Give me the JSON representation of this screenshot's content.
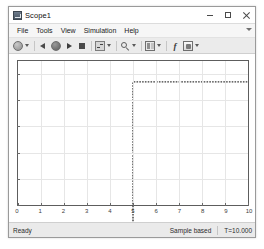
{
  "window": {
    "title": "Scope1",
    "icon": "scope-icon",
    "controls": {
      "minimize": "Minimize",
      "maximize": "Maximize",
      "close": "Close"
    }
  },
  "menu": {
    "items": [
      {
        "label": "File"
      },
      {
        "label": "Tools"
      },
      {
        "label": "View"
      },
      {
        "label": "Simulation"
      },
      {
        "label": "Help"
      }
    ],
    "overflow": "menu-caret-icon"
  },
  "toolbar": {
    "buttons": [
      {
        "name": "print-icon",
        "kind": "circle",
        "dropdown": true
      },
      {
        "name": "step-back-icon",
        "kind": "back",
        "dropdown": false
      },
      {
        "name": "rewind-icon",
        "kind": "circle-dark",
        "dropdown": false
      },
      {
        "name": "run-icon",
        "kind": "play",
        "dropdown": false
      },
      {
        "name": "stop-icon",
        "kind": "stop",
        "dropdown": false
      },
      {
        "name": "step-forward-icon",
        "kind": "step",
        "dropdown": true
      },
      {
        "name": "zoom-icon",
        "kind": "zoom",
        "dropdown": true
      },
      {
        "name": "layout-icon",
        "kind": "layout",
        "dropdown": true
      },
      {
        "name": "measurements-icon",
        "kind": "fx",
        "label": "f",
        "dropdown": false
      },
      {
        "name": "config-properties-icon",
        "kind": "cfg",
        "dropdown": true
      }
    ]
  },
  "statusbar": {
    "left": "Ready",
    "mode": "Sample based",
    "time": "T=10.000"
  },
  "chart_data": {
    "type": "line",
    "title": "",
    "xlabel": "",
    "ylabel": "",
    "xlim": [
      0,
      10
    ],
    "ylim": [
      0,
      1.1
    ],
    "xticks": [
      0,
      1,
      2,
      3,
      4,
      5,
      6,
      7,
      8,
      9,
      10
    ],
    "xticklabels": [
      "0",
      "1",
      "2",
      "3",
      "4",
      "5",
      "6",
      "7",
      "8",
      "9",
      "10"
    ],
    "yticks": [
      0,
      0.2,
      0.4,
      0.6,
      0.8,
      1
    ],
    "grid": true,
    "legend": null,
    "series": [
      {
        "name": "Step",
        "color": "#3a3a3a",
        "style": "step",
        "x": [
          0,
          5,
          5,
          10
        ],
        "y": [
          0,
          0,
          1,
          1
        ]
      }
    ]
  }
}
